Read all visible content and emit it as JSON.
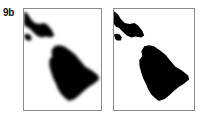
{
  "figure": {
    "label": "9b",
    "panels": [
      {
        "id": "panel-1",
        "description": "blurred island map",
        "islands": [
          "maui",
          "kahoolawe",
          "hawaii-big-island"
        ]
      },
      {
        "id": "panel-2",
        "description": "sharp island map",
        "islands": [
          "maui",
          "kahoolawe",
          "hawaii-big-island"
        ]
      }
    ],
    "colors": {
      "land": "#000000",
      "sea": "#ffffff",
      "border": "#8a8a8a"
    }
  }
}
